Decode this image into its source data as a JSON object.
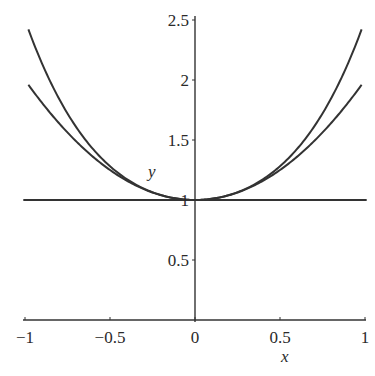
{
  "chart_data": {
    "type": "line",
    "title": "",
    "xlabel": "x",
    "ylabel": "y",
    "xlim": [
      -1,
      1
    ],
    "ylim": [
      0,
      2.5
    ],
    "grid": false,
    "legend": null,
    "x_ticks": [
      -1,
      -0.5,
      0,
      0.5,
      1
    ],
    "x_tick_labels": [
      "-1",
      "-0.5",
      "0",
      "0.5",
      "1"
    ],
    "y_ticks": [
      0.5,
      1,
      1.5,
      2,
      2.5
    ],
    "y_tick_labels": [
      "0.5",
      "1",
      "1.5",
      "2",
      "2.5"
    ],
    "x": [
      -1,
      -0.75,
      -0.5,
      -0.25,
      0,
      0.25,
      0.5,
      0.75,
      1
    ],
    "series": [
      {
        "name": "y = 1",
        "values": [
          1,
          1,
          1,
          1,
          1,
          1,
          1,
          1,
          1
        ]
      },
      {
        "name": "y = 1 + x^2",
        "values": [
          2,
          1.5625,
          1.25,
          1.0625,
          1,
          1.0625,
          1.25,
          1.5625,
          2
        ]
      },
      {
        "name": "y = 1 + x^2 + x^4/2",
        "values": [
          2.5,
          1.721,
          1.281,
          1.064,
          1,
          1.064,
          1.281,
          1.721,
          2.5
        ]
      }
    ],
    "line_color": "#333333"
  }
}
